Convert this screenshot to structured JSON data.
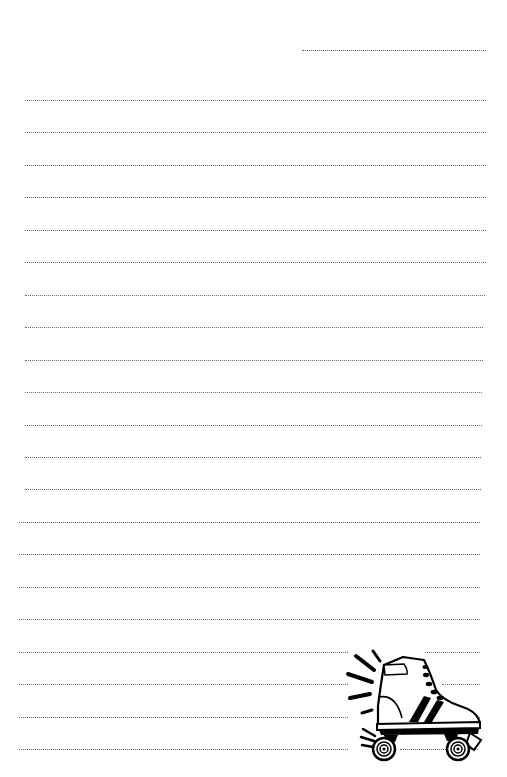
{
  "document": {
    "type": "lined-notepaper",
    "background_color": "#ffffff",
    "line_color": "#6b6b6b",
    "line_style": "dotted"
  },
  "date_line": {
    "x1": 302,
    "x2": 486,
    "y": 50
  },
  "rules": {
    "count": 21,
    "first_y": 100,
    "spacing": 32.45,
    "lines": [
      {
        "x1": 25,
        "x2": 486
      },
      {
        "x1": 25,
        "x2": 486
      },
      {
        "x1": 25,
        "x2": 486
      },
      {
        "x1": 25,
        "x2": 486
      },
      {
        "x1": 25,
        "x2": 486
      },
      {
        "x1": 25,
        "x2": 486
      },
      {
        "x1": 25,
        "x2": 485
      },
      {
        "x1": 25,
        "x2": 483
      },
      {
        "x1": 25,
        "x2": 483
      },
      {
        "x1": 25,
        "x2": 482
      },
      {
        "x1": 25,
        "x2": 482
      },
      {
        "x1": 25,
        "x2": 481
      },
      {
        "x1": 25,
        "x2": 481
      },
      {
        "x1": 19,
        "x2": 480
      },
      {
        "x1": 19,
        "x2": 480
      },
      {
        "x1": 19,
        "x2": 480
      },
      {
        "x1": 19,
        "x2": 480
      },
      {
        "x1": 19,
        "x2": 348
      },
      {
        "x1": 19,
        "x2": 348
      },
      {
        "x1": 19,
        "x2": 348
      },
      {
        "x1": 19,
        "x2": 348
      }
    ],
    "right_segments": [
      {
        "index": 17,
        "x1": 425,
        "x2": 480
      },
      {
        "index": 18,
        "x1": 442,
        "x2": 480
      },
      {
        "index": 19,
        "x1": 403,
        "x2": 480
      },
      {
        "index": 20,
        "x1": 400,
        "x2": 478
      }
    ]
  },
  "illustration": {
    "icon": "roller-skate-icon",
    "description": "Black and white roller skate clip art with motion lines",
    "stroke_color": "#000000"
  }
}
